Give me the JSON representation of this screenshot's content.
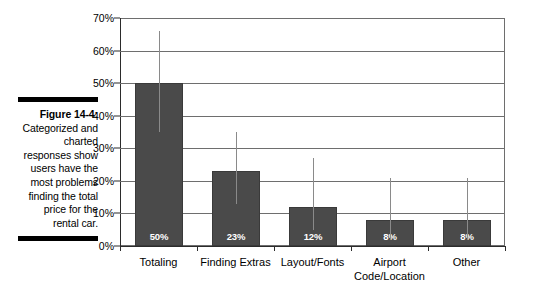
{
  "caption": {
    "figure_number": "Figure 14-4:",
    "body": "Categorized and charted responses show users have the most problems finding the total price for the rental car."
  },
  "chart_data": {
    "type": "bar",
    "title": "",
    "subtitle": "",
    "xlabel": "",
    "ylabel": "",
    "ylim": [
      0,
      70
    ],
    "grid": true,
    "legend": "none",
    "orientation": "vertical",
    "bar_color": "#4a4a4a",
    "errorbar_color": "#8a8a8a",
    "value_label_color": "#ffffff",
    "gridline_color": "#6e6e6e",
    "axis_color": "#2b2b2b",
    "ytick_labels": [
      "70%",
      "60%",
      "50%",
      "40%",
      "30%",
      "20%",
      "10%",
      "0%"
    ],
    "ytick_values": [
      70,
      60,
      50,
      40,
      30,
      20,
      10,
      0
    ],
    "categories": [
      "Totaling",
      "Finding Extras",
      "Layout/Fonts",
      "Airport\nCode/Location",
      "Other"
    ],
    "values": [
      50,
      23,
      12,
      8,
      8
    ],
    "value_labels": [
      "50%",
      "23%",
      "12%",
      "8%",
      "8%"
    ],
    "error_bars": [
      {
        "low": 35,
        "high": 66
      },
      {
        "low": 13,
        "high": 35
      },
      {
        "low": 5,
        "high": 27
      },
      {
        "low": 2,
        "high": 21
      },
      {
        "low": 2,
        "high": 21
      }
    ]
  }
}
